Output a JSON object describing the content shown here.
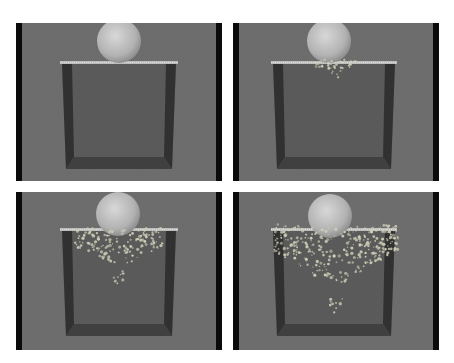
{
  "figure": {
    "layout": "2x2 grid",
    "colors": {
      "background": "#ffffff",
      "panel_bg": "#6f6f6f",
      "side_bar": "#0b0b0b",
      "box_wall_dark": "#2a2a2a",
      "box_inner": "#5a5a5a",
      "plate": "#bdbdbd",
      "sphere_light": "#d8d8d8",
      "sphere_dark": "#8a8a8a",
      "debris": "#cfcfb8"
    },
    "panels": [
      {
        "id": "frame-1",
        "position": "top-left",
        "x": 16,
        "y": 23,
        "debris_level": 0
      },
      {
        "id": "frame-2",
        "position": "top-right",
        "x": 233,
        "y": 23,
        "debris_level": 1
      },
      {
        "id": "frame-3",
        "position": "bottom-left",
        "x": 16,
        "y": 192,
        "debris_level": 2
      },
      {
        "id": "frame-4",
        "position": "bottom-right",
        "x": 233,
        "y": 192,
        "debris_level": 3
      }
    ]
  }
}
